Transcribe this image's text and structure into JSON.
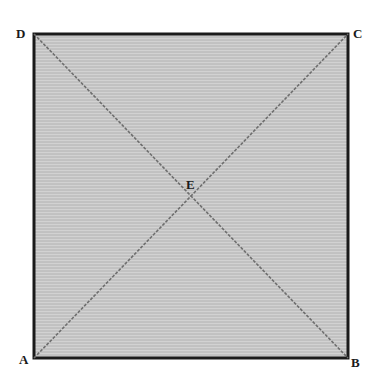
{
  "figure": {
    "shape": "square",
    "fill_color": "#c8c8c8",
    "stroke_color": "#1a1a1a",
    "diagonal_color": "#6e6e6e",
    "vertices": {
      "A": {
        "label": "A",
        "x": 34,
        "y": 358
      },
      "B": {
        "label": "B",
        "x": 348,
        "y": 358
      },
      "C": {
        "label": "C",
        "x": 348,
        "y": 34
      },
      "D": {
        "label": "D",
        "x": 34,
        "y": 34
      }
    },
    "center": {
      "label": "E",
      "x": 191,
      "y": 196
    },
    "diagonals": [
      "AC",
      "BD"
    ]
  }
}
